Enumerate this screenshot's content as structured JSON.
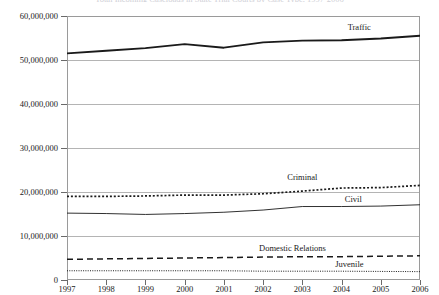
{
  "chart_data": {
    "type": "line",
    "title": "Total Incoming Caseloads in State Trial Courts by Case Type, 1997-2006",
    "xlabel": "",
    "ylabel": "",
    "x": [
      1997,
      1998,
      1999,
      2000,
      2001,
      2002,
      2003,
      2004,
      2005,
      2006
    ],
    "xtick_labels": [
      "1997",
      "1998",
      "1999",
      "2000",
      "2001",
      "2002",
      "2003",
      "2004",
      "2005",
      "2006"
    ],
    "ytick_labels": [
      "0",
      "10,000,000",
      "20,000,000",
      "30,000,000",
      "40,000,000",
      "50,000,000",
      "60,000,000"
    ],
    "ytick_values": [
      0,
      10000000,
      20000000,
      30000000,
      40000000,
      50000000,
      60000000
    ],
    "ylim": [
      0,
      60000000
    ],
    "xlim": [
      1997,
      2006
    ],
    "grid": true,
    "legend_position": "inline-labels",
    "series": [
      {
        "name": "Traffic",
        "style": "solid-thick",
        "color": "#1a1a1a",
        "label_x": 2004.45,
        "label_y": 57400000,
        "values": [
          51500000,
          52100000,
          52700000,
          53600000,
          52800000,
          54000000,
          54400000,
          54500000,
          54900000,
          55500000
        ]
      },
      {
        "name": "Criminal",
        "style": "dotted-bold",
        "color": "#1a1a1a",
        "label_x": 2003.0,
        "label_y": 23400000,
        "values": [
          19000000,
          19000000,
          19100000,
          19300000,
          19300000,
          19600000,
          20200000,
          20900000,
          21000000,
          21500000
        ]
      },
      {
        "name": "Civil",
        "style": "solid-thin",
        "color": "#1a1a1a",
        "label_x": 2004.3,
        "label_y": 18300000,
        "values": [
          15200000,
          15100000,
          14900000,
          15100000,
          15400000,
          15900000,
          16700000,
          16700000,
          16800000,
          17100000
        ]
      },
      {
        "name": "Domestic Relations",
        "style": "dashed",
        "color": "#1a1a1a",
        "label_x": 2002.75,
        "label_y": 7200000,
        "values": [
          4700000,
          4800000,
          4900000,
          5000000,
          5100000,
          5200000,
          5300000,
          5300000,
          5400000,
          5500000
        ]
      },
      {
        "name": "Juvenile",
        "style": "dotted-fine",
        "color": "#1a1a1a",
        "label_x": 2004.2,
        "label_y": 3700000,
        "values": [
          2100000,
          2100000,
          2100000,
          2100000,
          2100000,
          2000000,
          2000000,
          2000000,
          1950000,
          1900000
        ]
      }
    ]
  }
}
